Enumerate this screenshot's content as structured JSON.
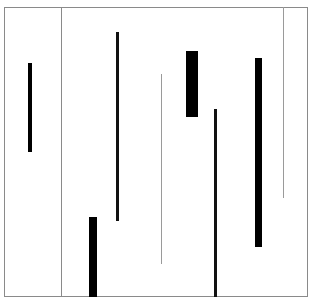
{
  "canvas": {
    "width": 309,
    "height": 302,
    "background": "#ffffff"
  },
  "frame": {
    "x": 4,
    "y": 7,
    "w": 304,
    "h": 290,
    "color": "#8a8a8a"
  },
  "dividers": [
    {
      "name": "divider-left",
      "x": 61,
      "y": 7,
      "w": 1,
      "h": 290,
      "color": "#8a8a8a"
    },
    {
      "name": "divider-right",
      "x": 283,
      "y": 7,
      "w": 1,
      "h": 191,
      "color": "#9a9a9a"
    },
    {
      "name": "thin-line-center",
      "x": 161,
      "y": 74,
      "w": 1,
      "h": 190,
      "color": "#9a9a9a"
    }
  ],
  "bars": [
    {
      "name": "bar-1",
      "x": 28,
      "y": 63,
      "w": 4,
      "h": 89,
      "color": "#000000"
    },
    {
      "name": "bar-2",
      "x": 116,
      "y": 32,
      "w": 3,
      "h": 189,
      "color": "#111111"
    },
    {
      "name": "bar-3",
      "x": 89,
      "y": 217,
      "w": 8,
      "h": 80,
      "color": "#000000"
    },
    {
      "name": "bar-4",
      "x": 186,
      "y": 51,
      "w": 12,
      "h": 66,
      "color": "#000000"
    },
    {
      "name": "bar-5",
      "x": 214,
      "y": 109,
      "w": 3,
      "h": 188,
      "color": "#111111"
    },
    {
      "name": "bar-6",
      "x": 255,
      "y": 58,
      "w": 7,
      "h": 189,
      "color": "#000000"
    }
  ]
}
